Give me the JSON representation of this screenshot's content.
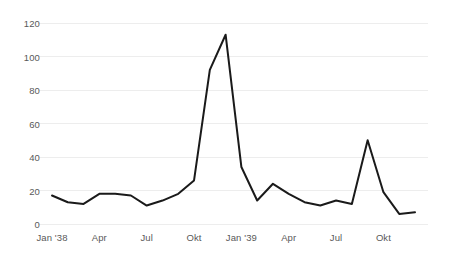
{
  "chart_data": {
    "type": "line",
    "title": "",
    "subtitle": "",
    "xlabel": "",
    "ylabel": "",
    "ylim": [
      0,
      120
    ],
    "yticks": [
      0,
      20,
      40,
      60,
      80,
      100,
      120
    ],
    "grid": true,
    "legend": false,
    "legend_position": "none",
    "line_color": "#1a1a1a",
    "gridline_color": "#ededed",
    "background_color": "#ffffff",
    "tick_label_color": "#595959",
    "x": [
      "Jan '38",
      "Feb '38",
      "Mrz '38",
      "Apr '38",
      "Mai '38",
      "Jun '38",
      "Jul '38",
      "Aug '38",
      "Sep '38",
      "Okt '38",
      "Nov '38",
      "Dez '38",
      "Jan '39",
      "Feb '39",
      "Mrz '39",
      "Apr '39",
      "Mai '39",
      "Jun '39",
      "Jul '39",
      "Aug '39",
      "Sep '39",
      "Okt '39",
      "Nov '39",
      "Dez '39"
    ],
    "xtick_labels": [
      "Jan '38",
      "Apr",
      "Jul",
      "Okt",
      "Jan '39",
      "Apr",
      "Jul",
      "Okt"
    ],
    "xtick_indices": [
      0,
      3,
      6,
      9,
      12,
      15,
      18,
      21
    ],
    "values": [
      17,
      13,
      12,
      18,
      18,
      17,
      11,
      14,
      18,
      26,
      92,
      113,
      34,
      14,
      24,
      18,
      13,
      11,
      14,
      12,
      50,
      19,
      6,
      7
    ]
  }
}
